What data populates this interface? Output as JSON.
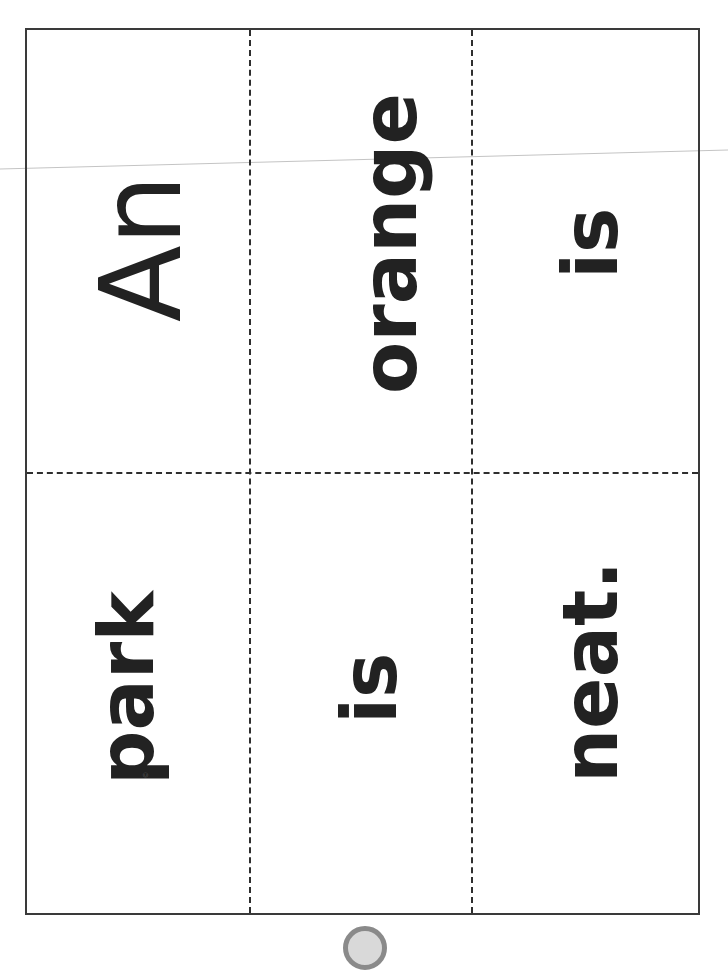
{
  "worksheet": {
    "type": "word-cards",
    "grid": {
      "rows": 2,
      "columns": 3
    },
    "cards": [
      {
        "row": 1,
        "col": 1,
        "word": "An"
      },
      {
        "row": 1,
        "col": 2,
        "word": "orange"
      },
      {
        "row": 1,
        "col": 3,
        "word": "is"
      },
      {
        "row": 2,
        "col": 1,
        "word": "park"
      },
      {
        "row": 2,
        "col": 2,
        "word": "is"
      },
      {
        "row": 2,
        "col": 3,
        "word": "neat."
      }
    ],
    "copyright_mark": "©"
  },
  "colors": {
    "text": "#222222",
    "border": "#3a3a3a",
    "dashed_divider": "#2e2e2e",
    "punch_hole_ring": "#8a8a8a",
    "punch_hole_fill": "#d9d9d9",
    "scan_line": "#bdbdbd"
  }
}
